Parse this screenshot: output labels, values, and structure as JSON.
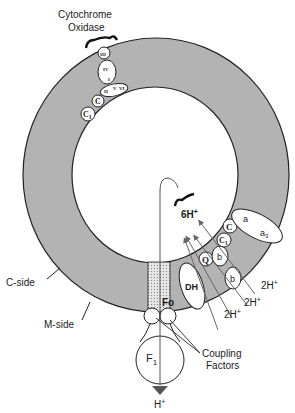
{
  "diagram": {
    "title_label": "Cytochrome Oxidase",
    "title_lines": [
      "Cytochrome",
      "Oxidase"
    ],
    "side_labels": {
      "c_side": "C-side",
      "m_side": "M-side"
    },
    "oxidase_subunits": [
      "III",
      "IV",
      "I",
      "II",
      "V",
      "VI"
    ],
    "chain_components": [
      "C",
      "C1",
      "a",
      "a3",
      "C",
      "C1",
      "b",
      "b",
      "Q",
      "DH"
    ],
    "proton_labels": {
      "pumped": "6H+",
      "release_1": "2H+",
      "release_2": "2H+",
      "release_3": "2H+",
      "return": "H+"
    },
    "atpase": {
      "fo": "Fo",
      "f1": "F1",
      "coupling": [
        "Coupling",
        "Factors"
      ]
    },
    "colors": {
      "membrane": "#b3b3b3",
      "line": "#222222",
      "stalk": "#d8d8d8"
    }
  }
}
